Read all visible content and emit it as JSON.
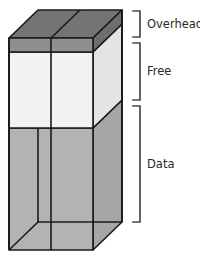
{
  "figure": {
    "name": "memory-block-diagram",
    "type": "3d-stacked-block",
    "background_color": "#ffffff",
    "outline_color": "#1a1a1a"
  },
  "segments": [
    {
      "id": "overhead",
      "label": "Overhead",
      "front_fill": "#8f8f8f",
      "top_fill": "#747474",
      "side_fill": "#6e6e6e",
      "order": 1
    },
    {
      "id": "free",
      "label": "Free",
      "front_fill": "#f2f2f0",
      "side_fill": "#e4e4e2",
      "order": 2
    },
    {
      "id": "data",
      "label": "Data",
      "front_fill": "#b3b3b3",
      "side_fill": "#a6a6a6",
      "order": 3
    }
  ],
  "brackets": [
    {
      "id": "bracket-overhead",
      "for": "overhead",
      "top": 11,
      "bottom": 37
    },
    {
      "id": "bracket-free",
      "for": "free",
      "top": 43,
      "bottom": 100
    },
    {
      "id": "bracket-data",
      "for": "data",
      "top": 106,
      "bottom": 222
    }
  ],
  "labels": {
    "overhead": "Overhead",
    "free": "Free",
    "data": "Data"
  }
}
